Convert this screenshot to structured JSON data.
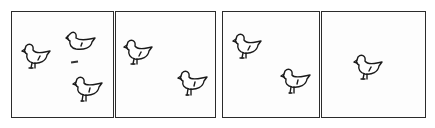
{
  "illustration": {
    "description": "Four-panel line drawing of chicks",
    "panels": [
      {
        "id": "panel-1",
        "chick_count": 3,
        "chicks": [
          "standing",
          "sitting",
          "standing"
        ]
      },
      {
        "id": "panel-2",
        "chick_count": 2,
        "chicks": [
          "standing",
          "standing"
        ]
      },
      {
        "id": "panel-3",
        "chick_count": 2,
        "chicks": [
          "standing",
          "standing"
        ]
      },
      {
        "id": "panel-4",
        "chick_count": 1,
        "chicks": [
          "standing"
        ]
      }
    ],
    "colors": {
      "line": "#1a1a1a",
      "background": "#ffffff"
    }
  }
}
